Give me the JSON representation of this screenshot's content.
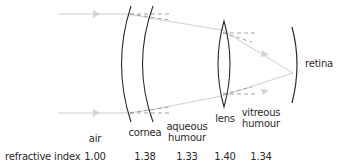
{
  "diagram": {
    "title_region": "refraction of light in the human eye",
    "colors": {
      "structure_stroke": "#2a2a2a",
      "ray": "#cfcfcf",
      "arrowhead": "#d4d4d4",
      "normal_dashed": "#9a9a9a"
    },
    "structures": {
      "cornea_label": "cornea",
      "lens_label": "lens",
      "retina_label": "retina"
    },
    "media": [
      {
        "name": "air",
        "refractive_index": "1.00"
      },
      {
        "name": "cornea",
        "refractive_index": "1.38"
      },
      {
        "name_line1": "aqueous",
        "name_line2": "humour",
        "refractive_index": "1.33"
      },
      {
        "name": "lens",
        "refractive_index": "1.40"
      },
      {
        "name_line1": "vitreous",
        "name_line2": "humour",
        "refractive_index": "1.34"
      }
    ],
    "row_label": "refractive index"
  }
}
